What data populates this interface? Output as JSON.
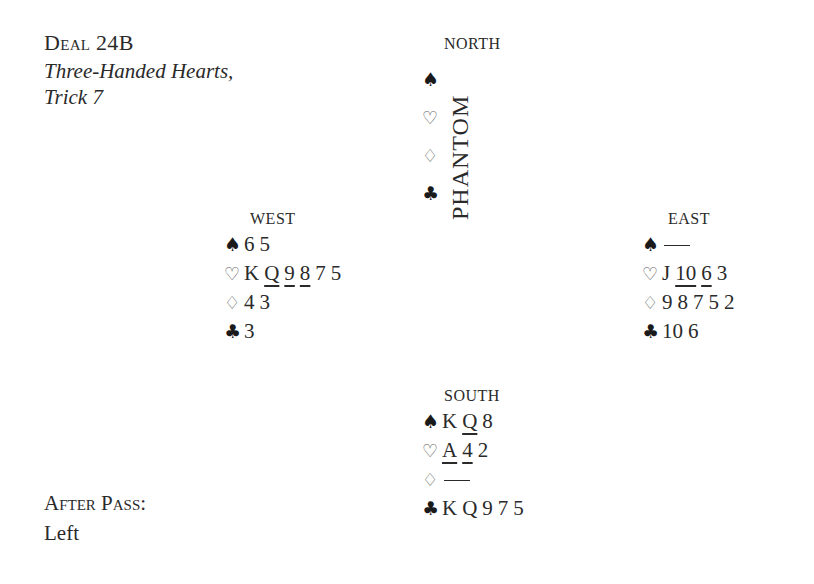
{
  "header": {
    "title": "Deal 24B",
    "subtitle_line1": "Three-Handed Hearts,",
    "subtitle_line2": "Trick 7"
  },
  "after_pass": {
    "label": "After Pass:",
    "value": "Left"
  },
  "suits": {
    "spades": "♠",
    "hearts": "♡",
    "diamonds": "♢",
    "clubs": "♣"
  },
  "north": {
    "label": "NORTH",
    "phantom_label": "PHANTOM"
  },
  "west": {
    "label": "WEST",
    "spades": [
      {
        "c": "6"
      },
      {
        "c": "5"
      }
    ],
    "hearts": [
      {
        "c": "K"
      },
      {
        "c": "Q",
        "ul": true
      },
      {
        "c": "9",
        "ul": true
      },
      {
        "c": "8",
        "ul": true
      },
      {
        "c": "7"
      },
      {
        "c": "5"
      }
    ],
    "diamonds": [
      {
        "c": "4"
      },
      {
        "c": "3"
      }
    ],
    "clubs": [
      {
        "c": "3"
      }
    ]
  },
  "east": {
    "label": "EAST",
    "spades": [],
    "hearts": [
      {
        "c": "J"
      },
      {
        "c": "10",
        "ul": true
      },
      {
        "c": "6",
        "ul": true
      },
      {
        "c": "3"
      }
    ],
    "diamonds": [
      {
        "c": "9"
      },
      {
        "c": "8"
      },
      {
        "c": "7"
      },
      {
        "c": "5"
      },
      {
        "c": "2"
      }
    ],
    "clubs": [
      {
        "c": "10"
      },
      {
        "c": "6"
      }
    ]
  },
  "south": {
    "label": "SOUTH",
    "spades": [
      {
        "c": "K"
      },
      {
        "c": "Q",
        "ul": true
      },
      {
        "c": "8"
      }
    ],
    "hearts": [
      {
        "c": "A",
        "ul": true
      },
      {
        "c": "4",
        "ul": true
      },
      {
        "c": "2"
      }
    ],
    "diamonds": [],
    "clubs": [
      {
        "c": "K"
      },
      {
        "c": "Q"
      },
      {
        "c": "9"
      },
      {
        "c": "7"
      },
      {
        "c": "5"
      }
    ]
  }
}
